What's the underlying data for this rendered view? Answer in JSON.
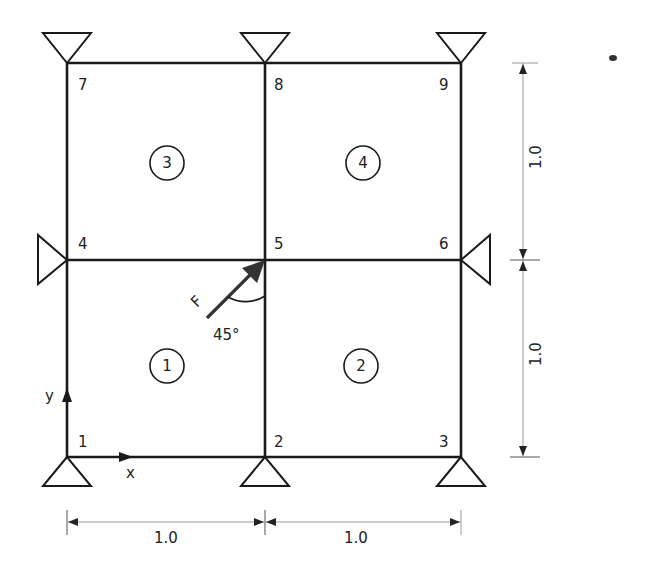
{
  "diagram": {
    "type": "finite-element-mesh",
    "nodes": [
      {
        "id": "1",
        "label": "1",
        "x": 67,
        "y": 457,
        "support": "pin-bottom"
      },
      {
        "id": "2",
        "label": "2",
        "x": 265,
        "y": 457,
        "support": "pin-bottom"
      },
      {
        "id": "3",
        "label": "3",
        "x": 461,
        "y": 457,
        "support": "pin-bottom"
      },
      {
        "id": "4",
        "label": "4",
        "x": 67,
        "y": 260,
        "support": "pin-left"
      },
      {
        "id": "5",
        "label": "5",
        "x": 265,
        "y": 260,
        "support": "none"
      },
      {
        "id": "6",
        "label": "6",
        "x": 461,
        "y": 260,
        "support": "pin-right"
      },
      {
        "id": "7",
        "label": "7",
        "x": 67,
        "y": 63,
        "support": "pin-top"
      },
      {
        "id": "8",
        "label": "8",
        "x": 265,
        "y": 63,
        "support": "pin-top"
      },
      {
        "id": "9",
        "label": "9",
        "x": 461,
        "y": 63,
        "support": "pin-top"
      }
    ],
    "elements": [
      {
        "id": "1",
        "label": "1",
        "nodes": [
          "1",
          "2",
          "5",
          "4"
        ]
      },
      {
        "id": "2",
        "label": "2",
        "nodes": [
          "2",
          "3",
          "6",
          "5"
        ]
      },
      {
        "id": "3",
        "label": "3",
        "nodes": [
          "4",
          "5",
          "8",
          "7"
        ]
      },
      {
        "id": "4",
        "label": "4",
        "nodes": [
          "5",
          "6",
          "9",
          "8"
        ]
      }
    ],
    "load": {
      "label": "F",
      "node": "5",
      "angle_label": "45°",
      "direction": "up-right at 45° from vertical"
    },
    "axes": {
      "x_label": "x",
      "y_label": "y"
    },
    "dimensions": {
      "horizontal": [
        "1.0",
        "1.0"
      ],
      "vertical": [
        "1.0",
        "1.0"
      ]
    },
    "colors": {
      "line": "#1a1a1a",
      "dimension_line": "#9a9a9a",
      "arrow": "#333333"
    }
  }
}
